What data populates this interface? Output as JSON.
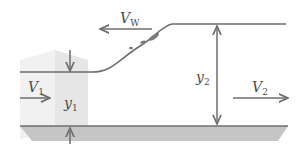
{
  "diagram": {
    "labels": {
      "v_w": "V",
      "v_w_sub": "W",
      "v1": "V",
      "v1_sub": "1",
      "y1": "y",
      "y1_sub": "1",
      "y2": "y",
      "y2_sub": "2",
      "v2": "V",
      "v2_sub": "2"
    },
    "colors": {
      "line": "#6e6e6e",
      "bed_fill": "#c8c8c8",
      "bed_hatch": "#b4b4b4",
      "prism": "#ececec",
      "prism_side": "#e2e2e2",
      "turbulence": "#7a7a7a",
      "text": "#4a4a4a"
    }
  }
}
